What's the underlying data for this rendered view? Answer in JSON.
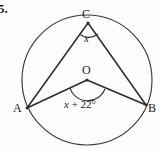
{
  "figure": {
    "problem_number": "5.",
    "type": "circle-geometry-diagram",
    "points": {
      "center_label": "O",
      "top_label": "C",
      "left_label": "A",
      "right_label": "B"
    },
    "angles": {
      "inscribed_at_c": "x",
      "central_at_o_variable": "x",
      "central_at_o_operator": "+",
      "central_at_o_constant": "22°",
      "central_at_o_full": "x + 22°"
    },
    "colors": {
      "stroke": "#2b2b2b",
      "circle_stroke": "#3a3a3a",
      "text": "#1a1a1a",
      "background": "#fdfdfc"
    },
    "geometry": {
      "circle_center_x": 87,
      "circle_center_y": 80,
      "circle_radius": 65,
      "point_c_x": 88,
      "point_c_y": 23,
      "point_o_x": 87,
      "point_o_y": 80,
      "point_a_x": 27,
      "point_a_y": 108,
      "point_b_x": 146,
      "point_b_y": 105
    }
  }
}
